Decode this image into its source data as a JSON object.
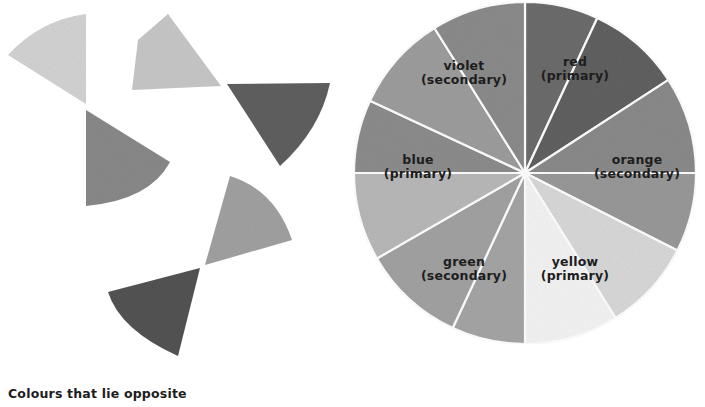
{
  "caption": "Colours that lie opposite",
  "complementary_pairs": [
    {
      "name": "pair-1",
      "wedges": [
        {
          "shade": "#d4d4d4",
          "path": "M86,14 L86,104 L8,55 Q40,20 86,14 Z"
        },
        {
          "shade": "#8a8a8a",
          "path": "M86,110 L170,162 Q150,200 86,206 Z"
        }
      ]
    },
    {
      "name": "pair-2",
      "wedges": [
        {
          "shade": "#c8c8c8",
          "path": "M168,14 L221,86 L132,90 L138,40 Z"
        },
        {
          "shade": "#616161",
          "path": "M227,84 L330,83 Q320,130 280,166 Z"
        }
      ]
    },
    {
      "name": "pair-3",
      "wedges": [
        {
          "shade": "#a2a2a2",
          "path": "M230,176 Q275,190 292,240 L205,265 Z"
        },
        {
          "shade": "#545454",
          "path": "M200,268 L178,356 Q120,330 108,292 Z"
        }
      ]
    }
  ],
  "wheel": {
    "center": [
      525,
      173
    ],
    "radius": 171,
    "segments": [
      {
        "start": -90,
        "end": -65,
        "shade": "#6d6d6d"
      },
      {
        "start": -65,
        "end": -33,
        "shade": "#626262"
      },
      {
        "start": -33,
        "end": 0,
        "shade": "#8b8b8b"
      },
      {
        "start": 0,
        "end": 27,
        "shade": "#9a9a9a"
      },
      {
        "start": 27,
        "end": 58,
        "shade": "#d9d9d9"
      },
      {
        "start": 58,
        "end": 90,
        "shade": "#f4f4f4"
      },
      {
        "start": 90,
        "end": 115,
        "shade": "#a6a6a6"
      },
      {
        "start": 115,
        "end": 150,
        "shade": "#a3a3a3"
      },
      {
        "start": 150,
        "end": 180,
        "shade": "#b9b9b9"
      },
      {
        "start": 180,
        "end": 205,
        "shade": "#8d8d8d"
      },
      {
        "start": 205,
        "end": 238,
        "shade": "#9e9e9e"
      },
      {
        "start": 238,
        "end": 270,
        "shade": "#8c8c8c"
      }
    ],
    "labels": [
      {
        "name": "violet",
        "line1": "violet",
        "line2": "(secondary)",
        "x": 464,
        "y": 70
      },
      {
        "name": "red",
        "line1": "red",
        "line2": "(primary)",
        "x": 575,
        "y": 66
      },
      {
        "name": "blue",
        "line1": "blue",
        "line2": "(primary)",
        "x": 418,
        "y": 164
      },
      {
        "name": "orange",
        "line1": "orange",
        "line2": "(secondary)",
        "x": 637,
        "y": 164
      },
      {
        "name": "green",
        "line1": "green",
        "line2": "(secondary)",
        "x": 464,
        "y": 266
      },
      {
        "name": "yellow",
        "line1": "yellow",
        "line2": "(primary)",
        "x": 575,
        "y": 266
      }
    ]
  }
}
